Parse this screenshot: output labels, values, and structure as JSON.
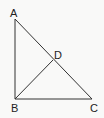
{
  "diagram": {
    "type": "geometry",
    "stroke_color": "#333333",
    "background": "#f9f9f8",
    "points": [
      {
        "name": "A",
        "x": 15,
        "y": 19,
        "label_x": 10,
        "label_y": 17
      },
      {
        "name": "B",
        "x": 15,
        "y": 99,
        "label_x": 11,
        "label_y": 112
      },
      {
        "name": "C",
        "x": 92,
        "y": 99,
        "label_x": 90,
        "label_y": 112
      },
      {
        "name": "D",
        "x": 53,
        "y": 60,
        "label_x": 54,
        "label_y": 59
      }
    ],
    "segments": [
      {
        "from": "A",
        "to": "B"
      },
      {
        "from": "B",
        "to": "C"
      },
      {
        "from": "A",
        "to": "C"
      },
      {
        "from": "B",
        "to": "D"
      }
    ],
    "labels": {
      "A": "A",
      "B": "B",
      "C": "C",
      "D": "D"
    }
  }
}
